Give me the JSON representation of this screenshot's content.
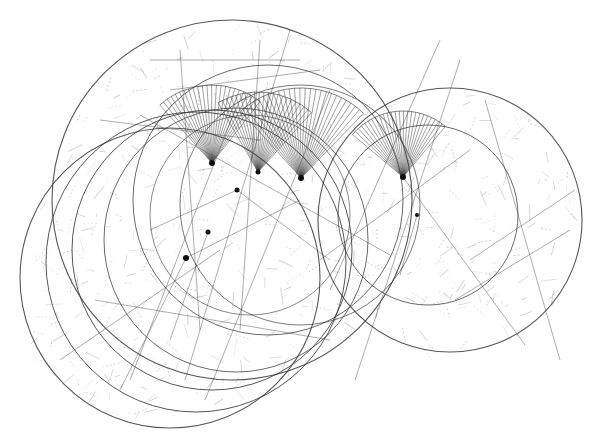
{
  "artwork": {
    "width": 593,
    "height": 442,
    "background": "#ffffff",
    "stroke_color": "#3a3a3a",
    "light_stroke_color": "#8a8a8a",
    "circles": [
      {
        "cx": 232,
        "cy": 200,
        "r": 180,
        "w": 1.1
      },
      {
        "cx": 450,
        "cy": 220,
        "r": 132,
        "w": 1.1
      },
      {
        "cx": 428,
        "cy": 215,
        "r": 90,
        "w": 0.9
      },
      {
        "cx": 170,
        "cy": 278,
        "r": 150,
        "w": 1.1
      },
      {
        "cx": 196,
        "cy": 262,
        "r": 150,
        "w": 1.0
      },
      {
        "cx": 212,
        "cy": 250,
        "r": 140,
        "w": 1.0
      },
      {
        "cx": 236,
        "cy": 240,
        "r": 132,
        "w": 0.9
      },
      {
        "cx": 268,
        "cy": 200,
        "r": 135,
        "w": 0.9
      },
      {
        "cx": 300,
        "cy": 205,
        "r": 120,
        "w": 0.8
      },
      {
        "cx": 250,
        "cy": 215,
        "r": 100,
        "w": 0.7
      }
    ],
    "fans": [
      {
        "ax": 212,
        "ay": 163,
        "r": 78,
        "start": -132,
        "end": -52,
        "n": 24
      },
      {
        "ax": 258,
        "ay": 172,
        "r": 80,
        "start": -120,
        "end": -48,
        "n": 22
      },
      {
        "ax": 301,
        "ay": 178,
        "r": 90,
        "start": -132,
        "end": -46,
        "n": 26
      },
      {
        "ax": 403,
        "ay": 177,
        "r": 66,
        "start": -140,
        "end": -50,
        "n": 26
      }
    ],
    "nodes": [
      {
        "x": 212,
        "y": 163,
        "r": 3
      },
      {
        "x": 258,
        "y": 172,
        "r": 2.5
      },
      {
        "x": 301,
        "y": 178,
        "r": 3
      },
      {
        "x": 403,
        "y": 177,
        "r": 3
      },
      {
        "x": 237,
        "y": 190,
        "r": 2.5
      },
      {
        "x": 208,
        "y": 232,
        "r": 2.5
      },
      {
        "x": 186,
        "y": 258,
        "r": 3
      },
      {
        "x": 417,
        "y": 215,
        "r": 2
      }
    ],
    "lines": [
      [
        140,
        115,
        390,
        255
      ],
      [
        100,
        120,
        260,
        140
      ],
      [
        185,
        380,
        290,
        30
      ],
      [
        205,
        400,
        330,
        90
      ],
      [
        130,
        380,
        235,
        110
      ],
      [
        320,
        260,
        470,
        150
      ],
      [
        403,
        177,
        525,
        345
      ],
      [
        417,
        215,
        400,
        275
      ],
      [
        180,
        50,
        200,
        330
      ],
      [
        260,
        40,
        240,
        330
      ],
      [
        60,
        360,
        220,
        250
      ],
      [
        95,
        300,
        330,
        340
      ],
      [
        330,
        290,
        440,
        40
      ],
      [
        355,
        380,
        460,
        60
      ],
      [
        150,
        60,
        300,
        60
      ],
      [
        170,
        90,
        320,
        70
      ],
      [
        186,
        258,
        120,
        390
      ],
      [
        186,
        258,
        300,
        200
      ],
      [
        208,
        232,
        170,
        340
      ],
      [
        237,
        190,
        330,
        260
      ],
      [
        237,
        190,
        150,
        230
      ],
      [
        485,
        100,
        560,
        360
      ],
      [
        470,
        260,
        575,
        190
      ],
      [
        455,
        300,
        570,
        230
      ]
    ],
    "hatch_count": 520,
    "hatch_seed": 7
  }
}
